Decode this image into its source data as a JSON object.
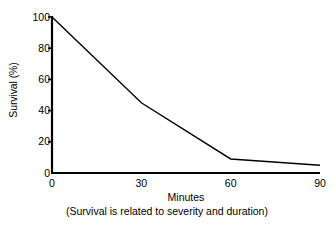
{
  "chart_data": {
    "type": "line",
    "title": "",
    "xlabel": "Minutes",
    "xsublabel": "(Survival is related to severity and duration)",
    "ylabel": "Survival (%)",
    "xlim": [
      0,
      90
    ],
    "ylim": [
      0,
      100
    ],
    "grid": false,
    "legend": "none",
    "xticks": [
      "0",
      "30",
      "60",
      "90"
    ],
    "xtick_values": [
      0,
      30,
      60,
      90
    ],
    "yticks": [
      "0",
      "20",
      "40",
      "60",
      "80",
      "100"
    ],
    "ytick_values": [
      0,
      20,
      40,
      60,
      80,
      100
    ],
    "line_color": "#000000",
    "axis_color": "#000000",
    "background_color": "#ffffff",
    "series": [
      {
        "name": "Survival",
        "x": [
          0,
          30,
          60,
          90
        ],
        "values": [
          100,
          45,
          9,
          5
        ]
      }
    ]
  }
}
